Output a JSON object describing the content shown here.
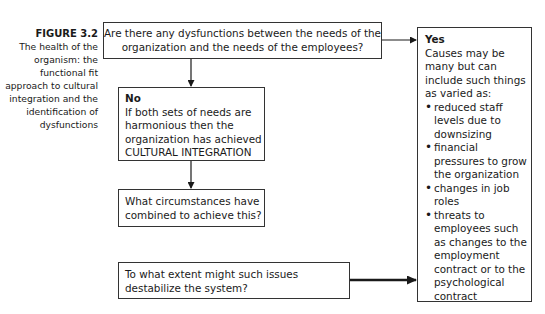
{
  "caption": {
    "figure_label": "FIGURE 3.2",
    "text": "The health of the organism: the functional fit approach to cultural integration and the identification of dysfunctions"
  },
  "nodes": {
    "question": "Are there any dysfunctions between the needs of the organization and the needs of the employees?",
    "no": {
      "heading": "No",
      "text": "If both sets of needs are harmonious then the organization has achieved CULTURAL INTEGRATION"
    },
    "circumstances": "What circumstances have combined to achieve this?",
    "destabilize": "To what extent might such issues destabilize the system?",
    "yes": {
      "heading": "Yes",
      "intro": "Causes may be many but can include such things as varied as:",
      "items": [
        "reduced staff levels due to downsizing",
        "financial pressures to grow the organization",
        "changes in job roles",
        "threats to employees such as changes to the employment contract or to the psychological contract"
      ]
    }
  },
  "edges": [
    {
      "from": "question",
      "to": "yes"
    },
    {
      "from": "question",
      "to": "no"
    },
    {
      "from": "no",
      "to": "circumstances"
    },
    {
      "from": "destabilize",
      "to": "yes"
    }
  ]
}
